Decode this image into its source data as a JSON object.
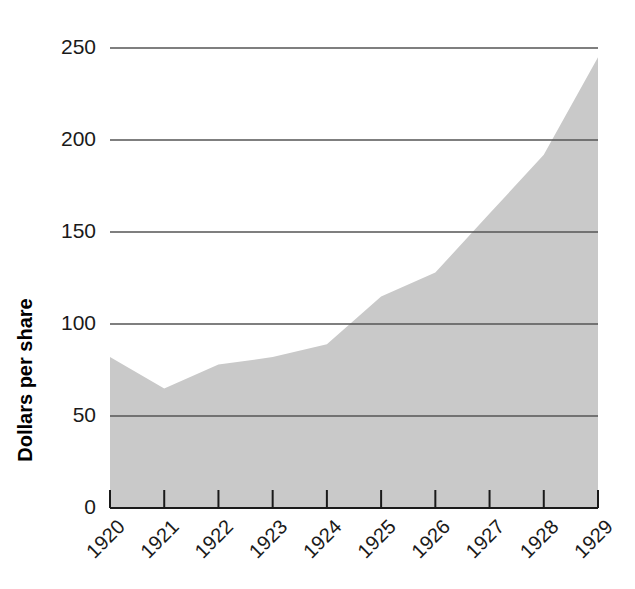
{
  "chart_data": {
    "type": "area",
    "title": "",
    "subtitle": "",
    "xlabel": "",
    "ylabel": "Dollars per share",
    "categories": [
      "1920",
      "1921",
      "1922",
      "1923",
      "1924",
      "1925",
      "1926",
      "1927",
      "1928",
      "1929"
    ],
    "values": [
      82,
      65,
      78,
      82,
      89,
      115,
      128,
      160,
      192,
      245
    ],
    "series": [
      {
        "name": "Dollars per share",
        "values": [
          82,
          65,
          78,
          82,
          89,
          115,
          128,
          160,
          192,
          245
        ]
      }
    ],
    "ylim": [
      0,
      250
    ],
    "yticks": [
      0,
      50,
      100,
      150,
      200,
      250
    ],
    "ytick_labels": [
      "0",
      "50",
      "100",
      "150",
      "200",
      "250"
    ],
    "xtick_labels": [
      "1920",
      "1921",
      "1922",
      "1923",
      "1924",
      "1925",
      "1926",
      "1927",
      "1928",
      "1929"
    ],
    "xtick_rotation_deg": 45,
    "grid": true,
    "grid_axis": "y",
    "legend": "none",
    "area_fill_color": "#c9c9c9",
    "grid_color": "#555555",
    "axis_color": "#1a1a1a",
    "background_color": "#ffffff"
  },
  "axes": {
    "y_axis_title": "Dollars per share"
  }
}
